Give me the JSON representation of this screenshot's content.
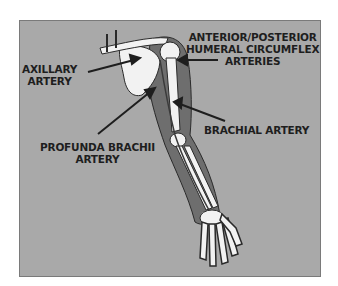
{
  "diagram": {
    "colors": {
      "background": "#a9a9a9",
      "muscle": "#6e6e6e",
      "bone": "#f2f2f2",
      "outline": "#2a2a2a",
      "text": "#1e1e1e"
    },
    "labels": [
      {
        "id": "axillary",
        "lines": [
          "AXILLARY",
          "ARTERY"
        ]
      },
      {
        "id": "circumflex",
        "lines": [
          "ANTERIOR/POSTERIOR",
          "HUMERAL CIRCUMFLEX",
          "ARTERIES"
        ]
      },
      {
        "id": "profunda",
        "lines": [
          "PROFUNDA BRACHII",
          "ARTERY"
        ]
      },
      {
        "id": "brachial",
        "lines": [
          "BRACHIAL ARTERY"
        ]
      }
    ]
  }
}
